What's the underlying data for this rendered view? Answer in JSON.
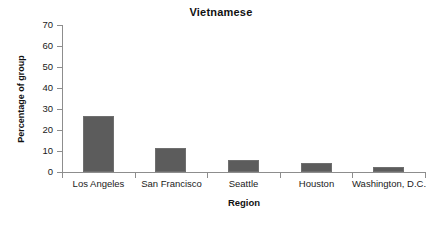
{
  "chart_data": {
    "type": "bar",
    "title": "Vietnamese",
    "xlabel": "Region",
    "ylabel": "Percentage of group",
    "categories": [
      "Los Angeles",
      "San Francisco",
      "Seattle",
      "Houston",
      "Washington, D.C."
    ],
    "values": [
      26.5,
      11.5,
      5.5,
      4.3,
      2.2
    ],
    "ylim": [
      0,
      70
    ],
    "ytick_labels": [
      "70",
      "60",
      "50",
      "40",
      "30",
      "20",
      "10",
      "0"
    ],
    "ytick_values": [
      70,
      60,
      50,
      40,
      30,
      20,
      10,
      0
    ],
    "grid": false,
    "legend": false,
    "series": [
      {
        "name": "Vietnamese",
        "values": [
          26.5,
          11.5,
          5.5,
          4.3,
          2.2
        ],
        "color": "#5c5c5c"
      }
    ]
  },
  "style": {
    "bar_color": "#5c5c5c",
    "bar_border_color": "#6f6f6f",
    "axis_color": "#8d8d8d",
    "text_color": "#1a1a1a",
    "background": "#ffffff"
  }
}
